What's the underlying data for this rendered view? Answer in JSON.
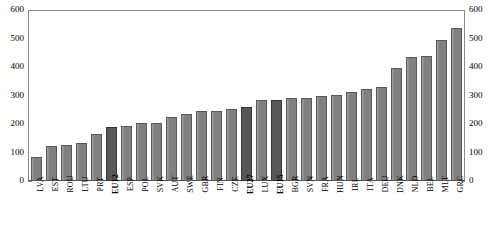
{
  "chart_data": {
    "type": "bar",
    "title": "",
    "subtitle": "",
    "xlabel": "",
    "ylabel": "",
    "ylim": [
      0,
      600
    ],
    "yticks": [
      0,
      100,
      200,
      300,
      400,
      500,
      600
    ],
    "y_axis_left_labels": [
      "600",
      "500",
      "400",
      "300",
      "200",
      "100",
      "0"
    ],
    "y_axis_right_labels": [
      "600",
      "500",
      "400",
      "300",
      "200",
      "100",
      "0"
    ],
    "grid": false,
    "legend": "none",
    "dual_axis": true,
    "bar_color": "#808080",
    "highlight_color": "#575757",
    "categories": [
      "LVA",
      "EST",
      "ROU",
      "LTU",
      "PRT",
      "EU12",
      "ESP",
      "POL",
      "SVK",
      "AUT",
      "SWE",
      "GBR",
      "FIN",
      "CZE",
      "EU27",
      "LUX",
      "EU15",
      "BGR",
      "SVN",
      "FRA",
      "HUN",
      "IRL",
      "ITA",
      "DEU",
      "DNK",
      "NLD",
      "BEL",
      "MLT",
      "GRC"
    ],
    "values": [
      85,
      122,
      127,
      134,
      165,
      190,
      193,
      203,
      203,
      226,
      236,
      247,
      247,
      251,
      258,
      283,
      285,
      291,
      293,
      300,
      303,
      313,
      322,
      330,
      395,
      435,
      438,
      494,
      537
    ],
    "highlighted": [
      "EU12",
      "EU27",
      "EU15"
    ],
    "bars": [
      {
        "label": "LVA",
        "value": 85,
        "highlight": false
      },
      {
        "label": "EST",
        "value": 122,
        "highlight": false
      },
      {
        "label": "ROU",
        "value": 127,
        "highlight": false
      },
      {
        "label": "LTU",
        "value": 134,
        "highlight": false
      },
      {
        "label": "PRT",
        "value": 165,
        "highlight": false
      },
      {
        "label": "EU12",
        "value": 190,
        "highlight": true
      },
      {
        "label": "ESP",
        "value": 193,
        "highlight": false
      },
      {
        "label": "POL",
        "value": 203,
        "highlight": false
      },
      {
        "label": "SVK",
        "value": 203,
        "highlight": false
      },
      {
        "label": "AUT",
        "value": 226,
        "highlight": false
      },
      {
        "label": "SWE",
        "value": 236,
        "highlight": false
      },
      {
        "label": "GBR",
        "value": 247,
        "highlight": false
      },
      {
        "label": "FIN",
        "value": 247,
        "highlight": false
      },
      {
        "label": "CZE",
        "value": 251,
        "highlight": false
      },
      {
        "label": "EU27",
        "value": 258,
        "highlight": true
      },
      {
        "label": "LUX",
        "value": 283,
        "highlight": false
      },
      {
        "label": "EU15",
        "value": 285,
        "highlight": true
      },
      {
        "label": "BGR",
        "value": 291,
        "highlight": false
      },
      {
        "label": "SVN",
        "value": 293,
        "highlight": false
      },
      {
        "label": "FRA",
        "value": 300,
        "highlight": false
      },
      {
        "label": "HUN",
        "value": 303,
        "highlight": false
      },
      {
        "label": "IRL",
        "value": 313,
        "highlight": false
      },
      {
        "label": "ITA",
        "value": 322,
        "highlight": false
      },
      {
        "label": "DEU",
        "value": 330,
        "highlight": false
      },
      {
        "label": "DNK",
        "value": 395,
        "highlight": false
      },
      {
        "label": "NLD",
        "value": 435,
        "highlight": false
      },
      {
        "label": "BEL",
        "value": 438,
        "highlight": false
      },
      {
        "label": "MLT",
        "value": 494,
        "highlight": false
      },
      {
        "label": "GRC",
        "value": 537,
        "highlight": false
      }
    ]
  }
}
